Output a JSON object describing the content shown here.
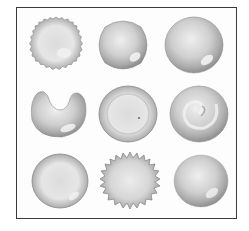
{
  "figure": {
    "frame_color": "#3a3a3a",
    "cell_shade_light": "#f2f2f2",
    "cell_shade_dark": "#8a8a8a",
    "cells": [
      {
        "row": 1,
        "col": 1,
        "shape": "crenated-disc"
      },
      {
        "row": 1,
        "col": 2,
        "shape": "rounded-square-cell"
      },
      {
        "row": 1,
        "col": 3,
        "shape": "spherocyte"
      },
      {
        "row": 2,
        "col": 1,
        "shape": "bitten-cell"
      },
      {
        "row": 2,
        "col": 2,
        "shape": "normal-biconcave-disc"
      },
      {
        "row": 2,
        "col": 3,
        "shape": "swirl-cell"
      },
      {
        "row": 3,
        "col": 1,
        "shape": "smooth-disc"
      },
      {
        "row": 3,
        "col": 2,
        "shape": "echinocyte-spiky"
      },
      {
        "row": 3,
        "col": 3,
        "shape": "sphere"
      }
    ]
  }
}
